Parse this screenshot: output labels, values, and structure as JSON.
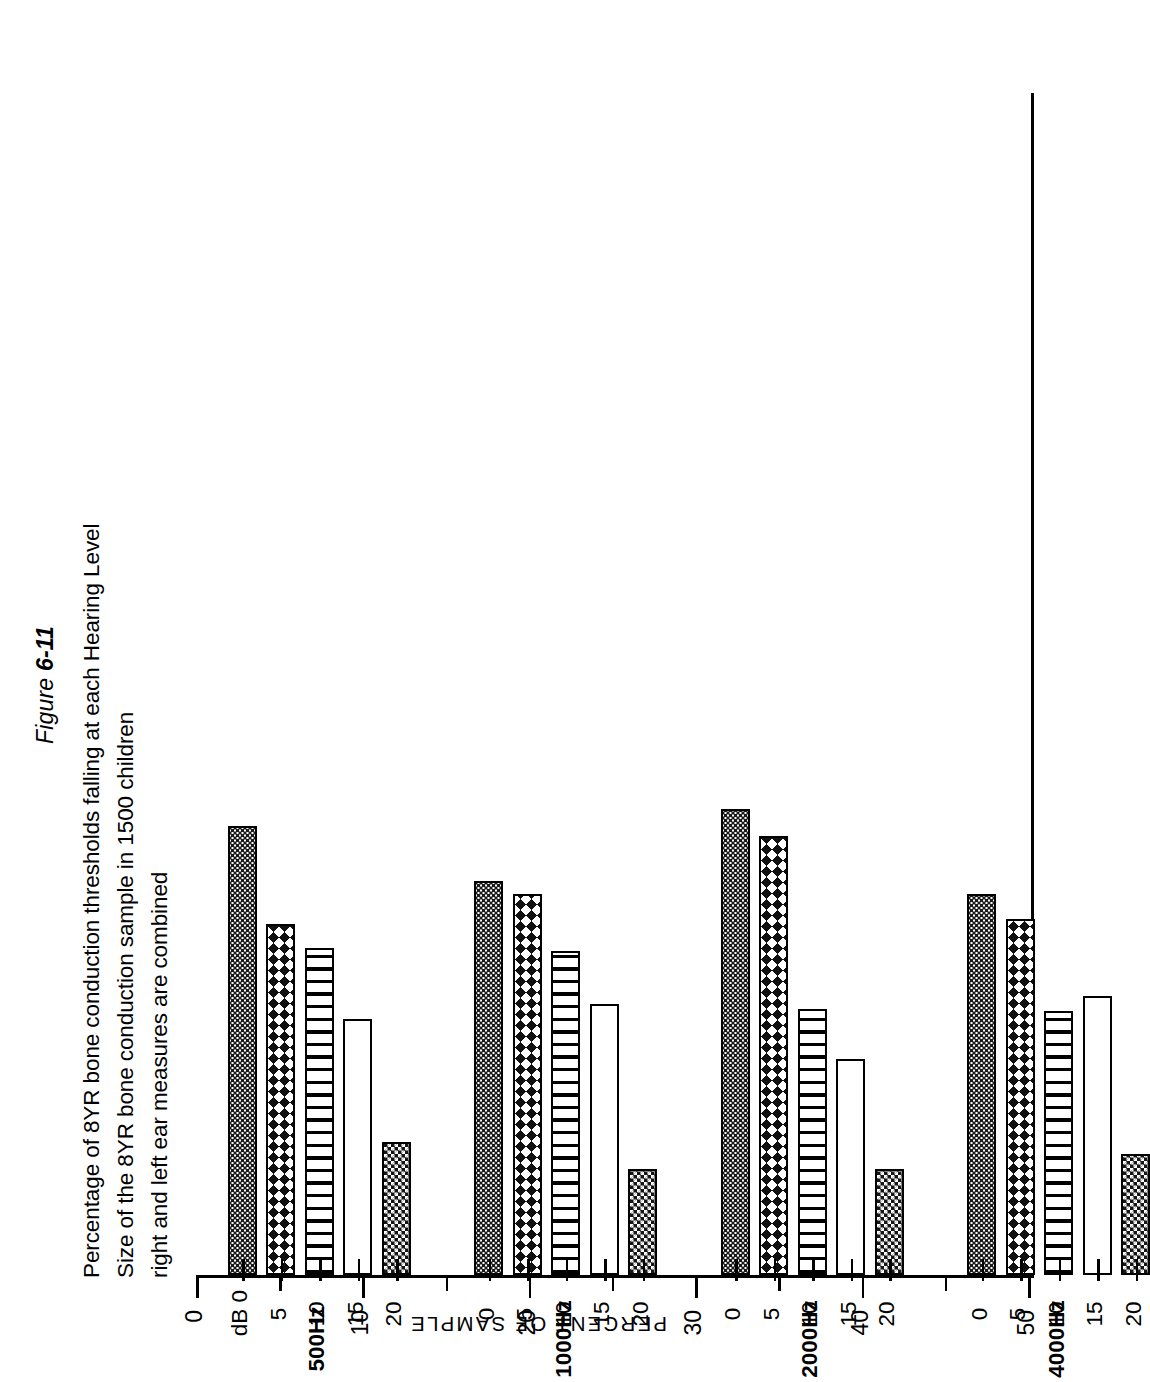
{
  "figure": {
    "number_prefix": "Figure ",
    "number": "6-11",
    "caption_lines": [
      "Percentage of 8YR bone conduction thresholds falling at each Hearing Level",
      "Size of the 8YR bone conduction sample in 1500 children",
      "right and left ear measures are combined"
    ]
  },
  "axes": {
    "value_axis_title": "PERCENT OF SAMPLE",
    "value_ticks": [
      "0",
      "10",
      "20",
      "30",
      "40",
      "50"
    ],
    "value_minor_ticks": [
      5,
      15,
      25,
      35,
      45
    ],
    "category_unit_label": "dB",
    "level_labels": [
      "0",
      "5",
      "10",
      "15",
      "20"
    ],
    "group_labels": [
      "500Hz",
      "1000Hz",
      "2000Hz",
      "4000Hz"
    ]
  },
  "legend_patterns": {
    "0": "fine-dot-stipple",
    "5": "diamond-crosshatch",
    "10": "vertical-stripes",
    "15": "open-white",
    "20": "dense-checkerboard"
  },
  "chart_data": {
    "type": "bar",
    "orientation": "horizontal",
    "title": "Percentage of 8YR bone conduction thresholds falling at each Hearing Level",
    "xlabel": "dB Hearing Level",
    "ylabel": "PERCENT OF SAMPLE",
    "ylim": [
      0,
      50
    ],
    "grid": false,
    "legend": "none",
    "categories": [
      "500Hz",
      "1000Hz",
      "2000Hz",
      "4000Hz"
    ],
    "levels": [
      "0",
      "5",
      "10",
      "15",
      "20"
    ],
    "series": [
      {
        "name": "0 dB",
        "pattern": "fine-dot-stipple",
        "values": [
          27.0,
          23.7,
          28.0,
          22.9
        ]
      },
      {
        "name": "5 dB",
        "pattern": "diamond-crosshatch",
        "values": [
          21.1,
          22.9,
          26.4,
          21.4
        ]
      },
      {
        "name": "10 dB",
        "pattern": "vertical-stripes",
        "values": [
          19.7,
          19.5,
          16.0,
          15.9
        ]
      },
      {
        "name": "15 dB",
        "pattern": "open-white",
        "values": [
          15.4,
          16.3,
          13.0,
          16.8
        ]
      },
      {
        "name": "20 dB",
        "pattern": "dense-checkerboard",
        "values": [
          8.0,
          6.4,
          6.4,
          7.3
        ]
      }
    ]
  }
}
